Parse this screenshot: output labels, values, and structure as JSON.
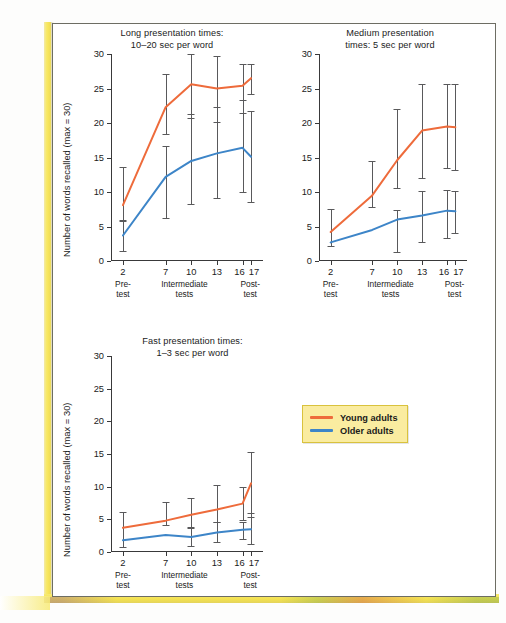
{
  "figure": {
    "y_axis_title": "Number of words recalled (max = 30)",
    "y_ticks": [
      "0",
      "5",
      "10",
      "15",
      "20",
      "25",
      "30"
    ],
    "x_ticks": [
      "2",
      "7",
      "10",
      "13",
      "16",
      "17"
    ],
    "x_groups": [
      "Pre-\ntest",
      "Intermediate\ntests",
      "Post-\ntest"
    ]
  },
  "legend": {
    "items": [
      {
        "label": "Young adults",
        "color": "#ee6b3b"
      },
      {
        "label": "Older adults",
        "color": "#3d85c8"
      }
    ]
  },
  "colors": {
    "young": "#ee6b3b",
    "older": "#3d85c8",
    "axis": "#39393a",
    "errorbar": "#59595b",
    "legend_bg": "#faeca0",
    "legend_border": "#d9c23d",
    "page_edge": "#f6e255"
  },
  "chart_data": [
    {
      "id": "long",
      "type": "line",
      "title": "Long presentation times:\n10–20 sec per word",
      "xlabel": "",
      "ylabel": "Number of words recalled (max = 30)",
      "ylim": [
        0,
        30
      ],
      "grid": false,
      "legend_position": "external",
      "categories": [
        "2",
        "7",
        "10",
        "13",
        "16",
        "17"
      ],
      "series": [
        {
          "name": "Young adults",
          "color": "#ee6b3b",
          "values": [
            8.1,
            22.3,
            25.6,
            25.0,
            25.4,
            26.5
          ],
          "err_low": [
            5.8,
            18.4,
            20.7,
            20.1,
            21.4,
            24.2
          ],
          "err_high": [
            13.6,
            27.1,
            30.0,
            29.7,
            28.5,
            28.5
          ]
        },
        {
          "name": "Older adults",
          "color": "#3d85c8",
          "values": [
            3.7,
            12.2,
            14.5,
            15.6,
            16.4,
            15.1
          ],
          "err_low": [
            1.5,
            6.3,
            8.3,
            9.2,
            10.0,
            8.5
          ],
          "err_high": [
            5.9,
            16.6,
            21.3,
            22.3,
            23.3,
            21.8
          ]
        }
      ]
    },
    {
      "id": "medium",
      "type": "line",
      "title": "Medium presentation\ntimes: 5 sec per word",
      "xlabel": "",
      "ylabel": "",
      "ylim": [
        0,
        30
      ],
      "grid": false,
      "legend_position": "external",
      "categories": [
        "2",
        "7",
        "10",
        "13",
        "16",
        "17"
      ],
      "series": [
        {
          "name": "Young adults",
          "color": "#ee6b3b",
          "values": [
            4.2,
            9.5,
            14.6,
            18.9,
            19.5,
            19.4
          ],
          "err_low": [
            2.2,
            7.8,
            10.6,
            12.0,
            13.5,
            13.2
          ],
          "err_high": [
            7.5,
            14.5,
            22.1,
            25.6,
            25.7,
            25.7
          ]
        },
        {
          "name": "Older adults",
          "color": "#3d85c8",
          "values": [
            2.7,
            4.5,
            6.0,
            6.6,
            7.3,
            7.2
          ],
          "err_low": [
            0.8,
            1.3,
            1.3,
            2.7,
            3.3,
            4.1
          ],
          "err_high": [
            7.5,
            14.5,
            7.4,
            10.2,
            10.3,
            10.2
          ]
        }
      ]
    },
    {
      "id": "fast",
      "type": "line",
      "title": "Fast presentation times:\n1–3 sec per word",
      "xlabel": "",
      "ylabel": "Number of words recalled (max = 30)",
      "ylim": [
        0,
        30
      ],
      "grid": false,
      "legend_position": "external",
      "categories": [
        "2",
        "7",
        "10",
        "13",
        "16",
        "17"
      ],
      "series": [
        {
          "name": "Young adults",
          "color": "#ee6b3b",
          "values": [
            3.7,
            4.8,
            5.7,
            6.5,
            7.4,
            10.5
          ],
          "err_low": [
            0.8,
            4.1,
            3.6,
            4.6,
            4.9,
            5.4
          ],
          "err_high": [
            6.1,
            7.6,
            8.3,
            10.3,
            10.0,
            15.3
          ]
        },
        {
          "name": "Older adults",
          "color": "#3d85c8",
          "values": [
            1.8,
            2.6,
            2.3,
            3.0,
            3.4,
            3.5
          ],
          "err_low": [
            0.8,
            1.4,
            0.9,
            1.6,
            2.0,
            1.3
          ],
          "err_high": [
            6.1,
            7.6,
            3.9,
            4.6,
            4.6,
            6.0
          ]
        }
      ]
    }
  ]
}
